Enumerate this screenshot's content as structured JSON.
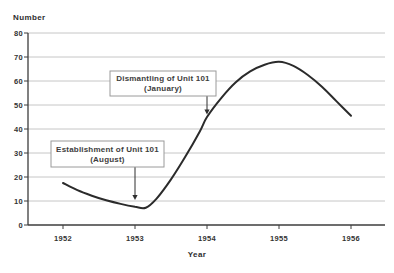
{
  "window": {
    "background": "#ffffff"
  },
  "chart_data": {
    "type": "line",
    "title": "",
    "ylabel": "Number",
    "xlabel": "Year",
    "x_ticks": [
      1952,
      1953,
      1954,
      1955,
      1956
    ],
    "y_ticks": [
      0,
      10,
      20,
      30,
      40,
      50,
      60,
      70,
      80
    ],
    "xlim": [
      1952,
      1956
    ],
    "ylim": [
      0,
      80
    ],
    "grid": "horizontal",
    "legend": "none",
    "colors": {
      "line": "#2b2b2b",
      "grid": "#c6c6c6",
      "axis": "#3c3c3c",
      "text": "#333333",
      "annotation_border": "#9a9a9a",
      "annotation_fill": "#ffffff"
    },
    "series": [
      {
        "name": "Number",
        "x": [
          1952,
          1952.2,
          1952.4,
          1952.6,
          1952.8,
          1953,
          1953.15,
          1953.3,
          1953.5,
          1953.7,
          1953.9,
          1954,
          1954.2,
          1954.4,
          1954.6,
          1954.8,
          1955,
          1955.2,
          1955.4,
          1955.6,
          1955.8,
          1956
        ],
        "y": [
          17.5,
          14.5,
          12.2,
          10.3,
          8.8,
          7.6,
          7.2,
          11,
          19,
          28.5,
          39,
          45,
          53,
          59.5,
          64,
          66.8,
          68,
          66.3,
          62.5,
          57.5,
          51.5,
          45.5
        ]
      }
    ],
    "annotations": [
      {
        "lines": [
          "Dismantling of Unit 101",
          "(January)"
        ],
        "arrow_year": 1954,
        "arrow_tip_value": 46,
        "box_px": {
          "x": 110,
          "y": 71,
          "w": 106,
          "h": 25
        }
      },
      {
        "lines": [
          "Establishment of Unit 101",
          "(August)"
        ],
        "arrow_year": 1953,
        "arrow_tip_value": 10.4,
        "box_px": {
          "x": 51,
          "y": 141,
          "w": 113,
          "h": 26
        }
      }
    ]
  }
}
